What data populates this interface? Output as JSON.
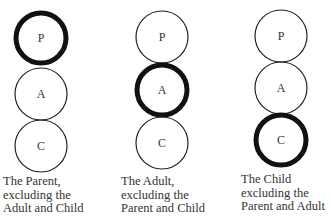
{
  "diagram": {
    "panels": [
      {
        "id": "parent",
        "highlighted": "P",
        "circles": [
          {
            "label": "P",
            "cx": 41,
            "cy": 38,
            "r": 26,
            "bold": true
          },
          {
            "label": "A",
            "cx": 41,
            "cy": 94,
            "r": 26,
            "bold": false
          },
          {
            "label": "C",
            "cx": 41,
            "cy": 146,
            "r": 26,
            "bold": false
          }
        ],
        "caption": [
          "The Parent,",
          "excluding the",
          "Adult and Child"
        ],
        "caption_x": 3,
        "caption_y": 175
      },
      {
        "id": "adult",
        "highlighted": "A",
        "circles": [
          {
            "label": "P",
            "cx": 162,
            "cy": 37,
            "r": 26,
            "bold": false
          },
          {
            "label": "A",
            "cx": 162,
            "cy": 90,
            "r": 26,
            "bold": true
          },
          {
            "label": "C",
            "cx": 162,
            "cy": 143,
            "r": 26,
            "bold": false
          }
        ],
        "caption": [
          "The Adult,",
          "excluding the",
          "Parent and Child"
        ],
        "caption_x": 121,
        "caption_y": 175
      },
      {
        "id": "child",
        "highlighted": "C",
        "circles": [
          {
            "label": "P",
            "cx": 281,
            "cy": 36,
            "r": 26,
            "bold": false
          },
          {
            "label": "A",
            "cx": 281,
            "cy": 88,
            "r": 26,
            "bold": false
          },
          {
            "label": "C",
            "cx": 281,
            "cy": 140,
            "r": 26,
            "bold": true
          }
        ],
        "caption": [
          "The Child",
          "excluding the",
          "Parent and Adult"
        ],
        "caption_x": 241,
        "caption_y": 173
      }
    ],
    "colors": {
      "stroke": "#1a1a1a",
      "text": "#333333",
      "background": "#ffffff"
    }
  }
}
